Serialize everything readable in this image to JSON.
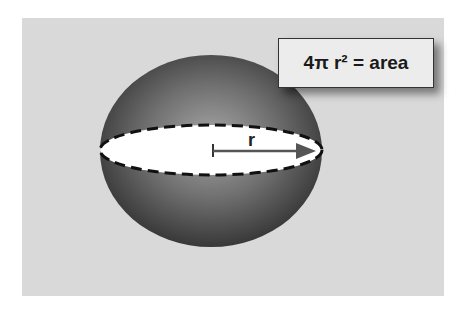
{
  "diagram": {
    "formula": "4π r² = area",
    "radius_label": "r",
    "colors": {
      "background": "#d9d9d9",
      "sphere_dark": "#3a3a3a",
      "sphere_light": "#9a9a9a",
      "equator_fill": "#ffffff",
      "arrow": "#555555",
      "box_fill": "#ececec"
    }
  }
}
